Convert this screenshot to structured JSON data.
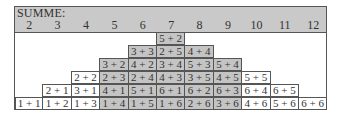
{
  "header": {
    "title": "SUMME:",
    "sums": [
      "2",
      "3",
      "4",
      "5",
      "6",
      "7",
      "8",
      "9",
      "10",
      "11",
      "12"
    ]
  },
  "colors": {
    "header_bg": "#c9c9c9",
    "shaded_cell": "#c4c4c4",
    "border": "#555555"
  },
  "shaded_sums": [
    5,
    6,
    7,
    8,
    9
  ],
  "rows": [
    [
      {
        "col": 5,
        "text": "5 + 2"
      }
    ],
    [
      {
        "col": 4,
        "text": "3 + 3"
      },
      {
        "col": 5,
        "text": "2 + 5"
      },
      {
        "col": 6,
        "text": "4 + 4"
      }
    ],
    [
      {
        "col": 3,
        "text": "3 + 2"
      },
      {
        "col": 4,
        "text": "4 + 2"
      },
      {
        "col": 5,
        "text": "3 + 4"
      },
      {
        "col": 6,
        "text": "5 + 3"
      },
      {
        "col": 7,
        "text": "5 + 4"
      }
    ],
    [
      {
        "col": 2,
        "text": "2 + 2"
      },
      {
        "col": 3,
        "text": "2 + 3"
      },
      {
        "col": 4,
        "text": "2 + 4"
      },
      {
        "col": 5,
        "text": "4 + 3"
      },
      {
        "col": 6,
        "text": "3 + 5"
      },
      {
        "col": 7,
        "text": "4 + 5"
      },
      {
        "col": 8,
        "text": "5 + 5"
      }
    ],
    [
      {
        "col": 1,
        "text": "2 + 1"
      },
      {
        "col": 2,
        "text": "3 + 1"
      },
      {
        "col": 3,
        "text": "4 + 1"
      },
      {
        "col": 4,
        "text": "5 + 1"
      },
      {
        "col": 5,
        "text": "6 + 1"
      },
      {
        "col": 6,
        "text": "6 + 2"
      },
      {
        "col": 7,
        "text": "6 + 3"
      },
      {
        "col": 8,
        "text": "6 + 4"
      },
      {
        "col": 9,
        "text": "6 + 5"
      }
    ],
    [
      {
        "col": 0,
        "text": "1 + 1"
      },
      {
        "col": 1,
        "text": "1 + 2"
      },
      {
        "col": 2,
        "text": "1 + 3"
      },
      {
        "col": 3,
        "text": "1 + 4"
      },
      {
        "col": 4,
        "text": "1 + 5"
      },
      {
        "col": 5,
        "text": "1 + 6"
      },
      {
        "col": 6,
        "text": "2 + 6"
      },
      {
        "col": 7,
        "text": "3 + 6"
      },
      {
        "col": 8,
        "text": "4 + 6"
      },
      {
        "col": 9,
        "text": "5 + 6"
      },
      {
        "col": 10,
        "text": "6 + 6"
      }
    ]
  ]
}
